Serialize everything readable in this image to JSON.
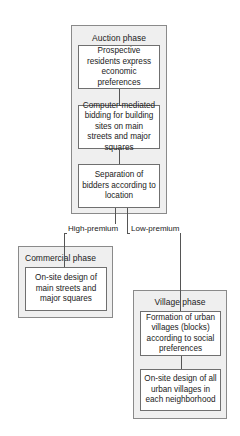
{
  "diagram": {
    "auction_phase": {
      "title": "Auction  phase",
      "steps": [
        "Prospective residents express economic preferences",
        "Computer-mediated bidding for building sites on main streets and major squares",
        "Separation of bidders according to location"
      ]
    },
    "branches": {
      "high": "High-premium",
      "low": "Low-premium"
    },
    "commercial_phase": {
      "title": "Commercial  phase",
      "steps": [
        "On-site design of main streets and major squares"
      ]
    },
    "village_phase": {
      "title": "Village  phase",
      "steps": [
        "Formation of urban villages (blocks) according to social preferences",
        "On-site design of all urban villages in each neighborhood"
      ]
    },
    "colors": {
      "phase_fill": "#efefef",
      "step_fill": "#ffffff",
      "line": "#555555"
    }
  }
}
